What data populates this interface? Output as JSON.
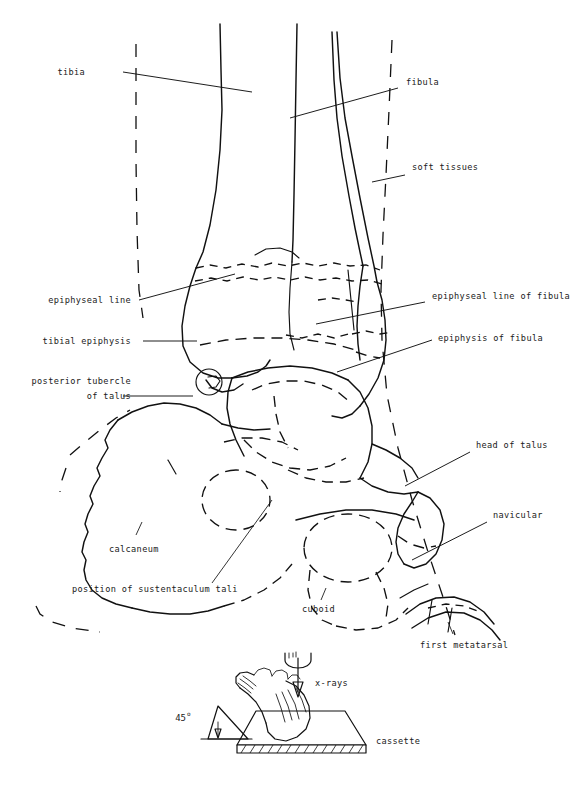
{
  "figure": {
    "faint_header_text": "",
    "ink_color": "#111111",
    "background_color": "#ffffff"
  },
  "labels": {
    "tibia": "tibia",
    "fibula": "fibula",
    "soft_tissues": "soft tissues",
    "epiphyseal_line": "epiphyseal line",
    "epiphyseal_line_of_fibula": "epiphyseal line of fibula",
    "tibial_epiphysis": "tibial epiphysis",
    "epiphysis_of_fibula": "epiphysis of fibula",
    "posterior_tubercle_line1": "posterior tubercle",
    "posterior_tubercle_line2": "of talus",
    "head_of_talus": "head of talus",
    "navicular": "navicular",
    "calcaneum": "calcaneum",
    "position_of_sustentaculum_tali": "position of sustentaculum tali",
    "cuboid": "cuboid",
    "first_metatarsal": "first metatarsal"
  },
  "inset": {
    "x_rays": "x-rays",
    "cassette": "cassette",
    "angle_value": "45",
    "angle_degree_symbol": "o"
  }
}
